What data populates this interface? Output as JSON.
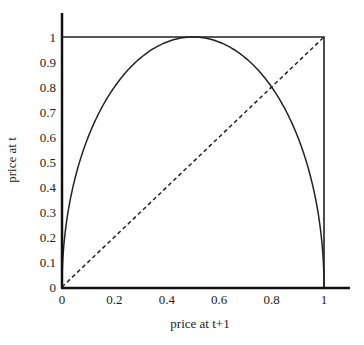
{
  "chart_data": {
    "type": "line",
    "title": "",
    "xlabel": "price at t+1",
    "ylabel": "price at t",
    "xlim": [
      0,
      1.1
    ],
    "ylim": [
      0,
      1.1
    ],
    "grid": false,
    "legend": "none",
    "x_ticks": [
      "0",
      "0.2",
      "0.4",
      "0.6",
      "0.8",
      "1"
    ],
    "x_tick_values": [
      0,
      0.2,
      0.4,
      0.6,
      0.8,
      1
    ],
    "y_ticks": [
      "0",
      "0.1",
      "0.2",
      "0.3",
      "0.4",
      "0.5",
      "0.6",
      "0.7",
      "0.8",
      "0.9",
      "1"
    ],
    "y_tick_values": [
      0,
      0.1,
      0.2,
      0.3,
      0.4,
      0.5,
      0.6,
      0.7,
      0.8,
      0.9,
      1
    ],
    "series": [
      {
        "name": "map curve",
        "style": "solid",
        "function": "y = 2*sqrt(x*(1-x))",
        "x": [
          0,
          0.01,
          0.05,
          0.1,
          0.2,
          0.3,
          0.4,
          0.5,
          0.6,
          0.7,
          0.8,
          0.9,
          0.95,
          0.99,
          1
        ],
        "y": [
          0,
          0.199,
          0.436,
          0.6,
          0.8,
          0.917,
          0.98,
          1,
          0.98,
          0.917,
          0.8,
          0.6,
          0.436,
          0.199,
          0
        ]
      },
      {
        "name": "45-degree line",
        "style": "dashed",
        "x": [
          0,
          1
        ],
        "y": [
          0,
          1
        ]
      },
      {
        "name": "unit box",
        "style": "solid",
        "x": [
          0,
          1,
          1
        ],
        "y": [
          1,
          1,
          0
        ]
      }
    ]
  }
}
